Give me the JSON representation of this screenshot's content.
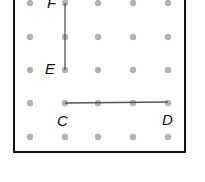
{
  "diagram": {
    "type": "dot-grid",
    "grid": {
      "columns": 5,
      "rows": 5,
      "dot_color": "#b3b3b3",
      "line_color": "#555555"
    },
    "points": [
      {
        "label": "F",
        "col": 1,
        "row": 0
      },
      {
        "label": "E",
        "col": 1,
        "row": 2
      },
      {
        "label": "C",
        "col": 1,
        "row": 3
      },
      {
        "label": "D",
        "col": 4,
        "row": 3
      }
    ],
    "segments": [
      {
        "from": "F",
        "to": "E"
      },
      {
        "from": "C",
        "to": "D"
      }
    ]
  },
  "labels": {
    "F": "F",
    "E": "E",
    "C": "C",
    "D": "D"
  }
}
